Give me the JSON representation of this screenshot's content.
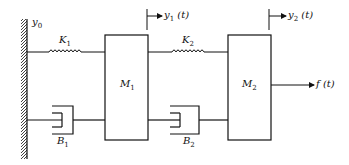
{
  "diagram": {
    "wall_label": "y",
    "wall_label_sub": "0",
    "spring1": {
      "label": "K",
      "sub": "1"
    },
    "spring2": {
      "label": "K",
      "sub": "2"
    },
    "mass1": {
      "label": "M",
      "sub": "1"
    },
    "mass2": {
      "label": "M",
      "sub": "2"
    },
    "damper1": {
      "label": "B",
      "sub": "1"
    },
    "damper2": {
      "label": "B",
      "sub": "2"
    },
    "disp1": {
      "label": "y",
      "sub": "1",
      "arg": " (t)"
    },
    "disp2": {
      "label": "y",
      "sub": "2",
      "arg": " (t)"
    },
    "force": {
      "label": "f",
      "arg": " (t)"
    },
    "line_color": "#111111"
  }
}
